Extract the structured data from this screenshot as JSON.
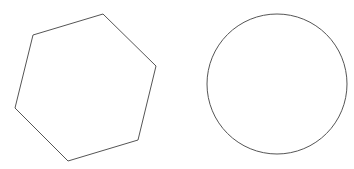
{
  "canvas": {
    "width": 354,
    "height": 169,
    "background": "#ffffff"
  },
  "shapes": {
    "hexagon": {
      "points": "33,35 103,14 156,66 138,140 68,161 15,108",
      "stroke": "#555555",
      "fill": "none"
    },
    "circle": {
      "cx": 277,
      "cy": 84,
      "r": 70,
      "stroke": "#555555",
      "fill": "none"
    }
  }
}
